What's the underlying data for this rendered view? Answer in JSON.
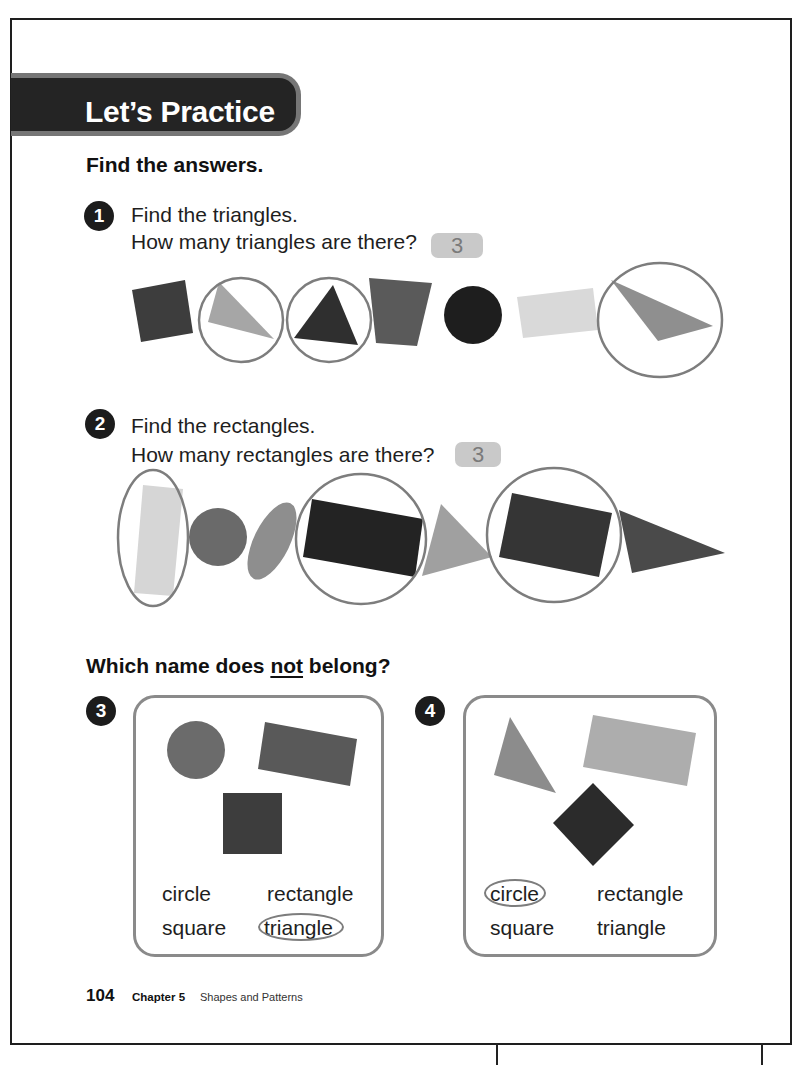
{
  "banner": {
    "title": "Let’s Practice"
  },
  "section_find": {
    "heading": "Find the answers."
  },
  "problems": [
    {
      "number": "1",
      "prompt": "Find the triangles.",
      "question": "How many triangles are there?",
      "answer": "3",
      "shapes": [
        {
          "kind": "square",
          "fill": "#3d3d3d",
          "circled": false
        },
        {
          "kind": "triangle",
          "fill": "#a6a6a6",
          "circled": true
        },
        {
          "kind": "triangle",
          "fill": "#2f2f2f",
          "circled": true
        },
        {
          "kind": "trapezoid",
          "fill": "#5a5a5a",
          "circled": false
        },
        {
          "kind": "circle",
          "fill": "#1e1e1e",
          "circled": false
        },
        {
          "kind": "rectangle",
          "fill": "#d9d9d9",
          "circled": false
        },
        {
          "kind": "triangle",
          "fill": "#8f8f8f",
          "circled": true
        }
      ]
    },
    {
      "number": "2",
      "prompt": "Find the rectangles.",
      "question": "How many rectangles are there?",
      "answer": "3",
      "shapes": [
        {
          "kind": "rectangle",
          "fill": "#d6d6d6",
          "circled": true
        },
        {
          "kind": "circle",
          "fill": "#6a6a6a",
          "circled": false
        },
        {
          "kind": "oval",
          "fill": "#8e8e8e",
          "circled": false
        },
        {
          "kind": "rectangle",
          "fill": "#232323",
          "circled": true
        },
        {
          "kind": "triangle",
          "fill": "#a0a0a0",
          "circled": false
        },
        {
          "kind": "rectangle",
          "fill": "#353535",
          "circled": true
        },
        {
          "kind": "triangle",
          "fill": "#4a4a4a",
          "circled": false
        }
      ]
    }
  ],
  "section_belong": {
    "heading_start": "Which name does ",
    "heading_emphasis": "not",
    "heading_end": " belong?"
  },
  "choice_problems": [
    {
      "number": "3",
      "shapes": [
        {
          "kind": "circle",
          "fill": "#6b6b6b"
        },
        {
          "kind": "rectangle",
          "fill": "#595959"
        },
        {
          "kind": "square",
          "fill": "#3d3d3d"
        }
      ],
      "options": [
        {
          "label": "circle",
          "circled": false
        },
        {
          "label": "rectangle",
          "circled": false
        },
        {
          "label": "square",
          "circled": false
        },
        {
          "label": "triangle",
          "circled": true
        }
      ]
    },
    {
      "number": "4",
      "shapes": [
        {
          "kind": "triangle",
          "fill": "#8c8c8c"
        },
        {
          "kind": "rectangle",
          "fill": "#adadad"
        },
        {
          "kind": "square",
          "fill": "#2b2b2b"
        }
      ],
      "options": [
        {
          "label": "circle",
          "circled": true
        },
        {
          "label": "rectangle",
          "circled": false
        },
        {
          "label": "square",
          "circled": false
        },
        {
          "label": "triangle",
          "circled": false
        }
      ]
    }
  ],
  "footer": {
    "page_number": "104",
    "chapter": "Chapter 5",
    "chapter_title": "Shapes and Patterns"
  },
  "colors": {
    "banner_bg": "#242424",
    "banner_border": "#767676",
    "answer_box_bg": "#c9c9c9",
    "circle_mark": "#7d7d7d",
    "choice_box_border": "#8a8a8a"
  }
}
